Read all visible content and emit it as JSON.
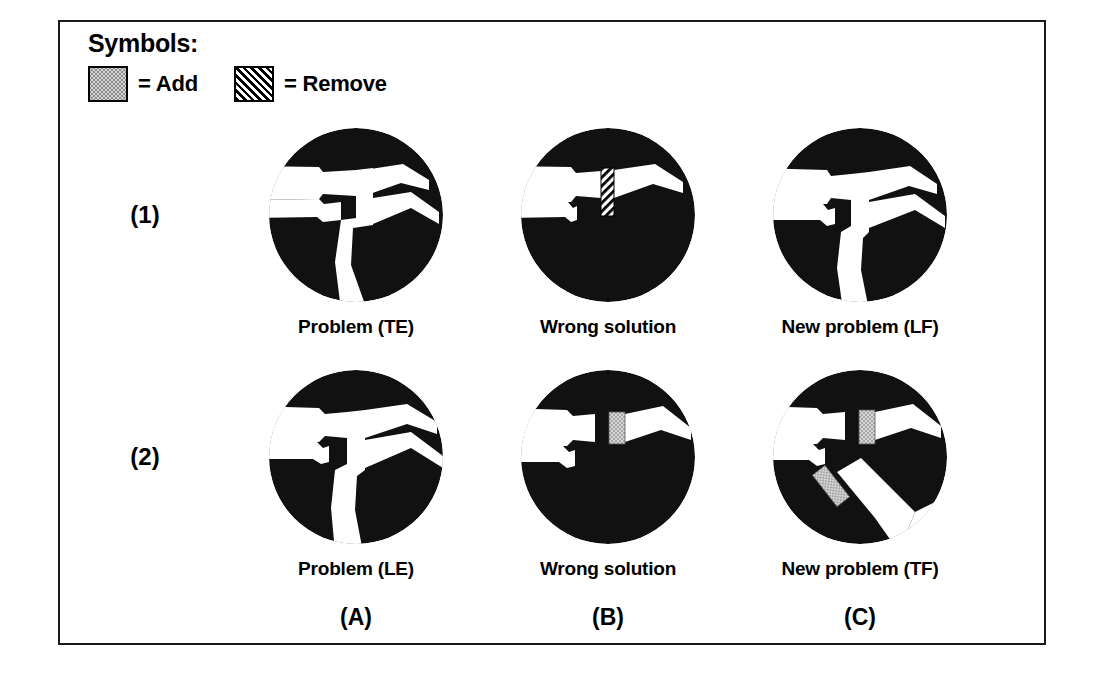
{
  "figure": {
    "legend": {
      "title": "Symbols:",
      "entries": [
        {
          "symbol": "add-swatch",
          "pattern": "stipple-gray",
          "text": "= Add"
        },
        {
          "symbol": "remove-swatch",
          "pattern": "diagonal-hatch",
          "text": "= Remove"
        }
      ]
    },
    "row_labels": [
      "(1)",
      "(2)"
    ],
    "column_labels": [
      "(A)",
      "(B)",
      "(C)"
    ],
    "rows": [
      {
        "id": "row-1",
        "label": "(1)",
        "panels": [
          {
            "id": "panel-1a",
            "caption": "Problem (TE)",
            "marks": []
          },
          {
            "id": "panel-1b",
            "caption": "Wrong solution",
            "marks": [
              "remove"
            ]
          },
          {
            "id": "panel-1c",
            "caption": "New problem (LF)",
            "marks": []
          }
        ]
      },
      {
        "id": "row-2",
        "label": "(2)",
        "panels": [
          {
            "id": "panel-2a",
            "caption": "Problem (LE)",
            "marks": []
          },
          {
            "id": "panel-2b",
            "caption": "Wrong solution",
            "marks": [
              "add"
            ]
          },
          {
            "id": "panel-2c",
            "caption": "New problem (TF)",
            "marks": [
              "add",
              "add"
            ]
          }
        ]
      }
    ],
    "colors": {
      "solid": "#111111",
      "background": "#ffffff",
      "add_fill": "#d2d2d2",
      "add_dot": "#8f8f8f",
      "remove_line": "#000000",
      "frame": "#1a1a1a"
    }
  }
}
